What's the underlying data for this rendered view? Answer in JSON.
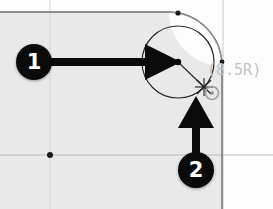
{
  "app": {
    "type": "cad-annotated-screenshot",
    "description": "CAD sketch corner fillet with numbered instruction callouts"
  },
  "drawing": {
    "background_color": "#e9e9e9",
    "page_color": "#fdfdfd",
    "line_color": "#7a7a7a",
    "edge_color": "#5a5a5a",
    "fillet_radius_label": "(8.5R)",
    "fillet_label_color": "#c2c2c2"
  },
  "callouts": [
    {
      "number": "1",
      "name": "callout-one",
      "target": "circle-center-point",
      "direction": "right"
    },
    {
      "number": "2",
      "name": "callout-two",
      "target": "arc-snap-point",
      "direction": "up"
    }
  ],
  "geometry": {
    "construction_circle": {
      "center_x": 178,
      "center_y": 62,
      "radius": 36,
      "stroke": "#2b2b2b"
    },
    "radius_line": {
      "from_x": 178,
      "from_y": 62,
      "to_x": 204,
      "to_y": 87
    },
    "snap_marker": {
      "kind": "x-cross",
      "x": 204,
      "y": 87
    },
    "point_marker": {
      "kind": "circle-dot",
      "x": 212,
      "y": 93
    },
    "corner_arc": {
      "radius": 54,
      "corner": "top-right"
    },
    "endpoints": [
      {
        "name": "arc-top-endpoint",
        "x": 178,
        "y": 13
      },
      {
        "name": "arc-right-endpoint",
        "x": 222,
        "y": 62
      },
      {
        "name": "center-origin-point",
        "x": 50,
        "y": 155
      }
    ],
    "centerlines": [
      {
        "name": "horizontal-centerline",
        "y": 155
      },
      {
        "name": "vertical-centerline",
        "x": 50
      }
    ]
  }
}
